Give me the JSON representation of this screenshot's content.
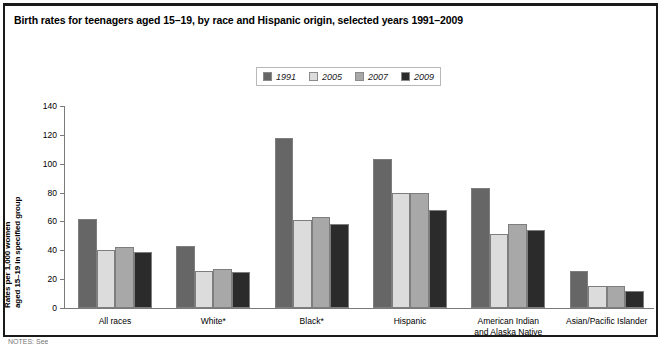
{
  "title": "Birth rates for teenagers aged 15–19, by race and Hispanic origin, selected years 1991–2009",
  "footnote": "NOTES: See",
  "legend": {
    "items": [
      {
        "label": "1991",
        "color": "#666666"
      },
      {
        "label": "2005",
        "color": "#dcdcdc"
      },
      {
        "label": "2007",
        "color": "#a8a8a8"
      },
      {
        "label": "2009",
        "color": "#2b2b2b"
      }
    ]
  },
  "axis": {
    "y_title_line1": "Rates per 1,000 women",
    "y_title_line2": "aged 15–19 in specified group",
    "y_ticks": [
      "140",
      "120",
      "100",
      "80",
      "60",
      "40",
      "20",
      "0"
    ]
  },
  "chart_data": {
    "type": "bar",
    "title": "Birth rates for teenagers aged 15–19, by race and Hispanic origin, selected years 1991–2009",
    "xlabel": "",
    "ylabel": "Rates per 1,000 women aged 15–19 in specified group",
    "ylim": [
      0,
      140
    ],
    "ytick_step": 20,
    "grid": false,
    "legend_position": "top-center",
    "categories": [
      "All races",
      "White*",
      "Black*",
      "Hispanic",
      "American Indian and Alaska Native",
      "Asian/Pacific Islander"
    ],
    "category_labels": [
      [
        "All races"
      ],
      [
        "White*"
      ],
      [
        "Black*"
      ],
      [
        "Hispanic"
      ],
      [
        "American Indian",
        "and Alaska Native"
      ],
      [
        "Asian/Pacific Islander"
      ]
    ],
    "series": [
      {
        "name": "1991",
        "color": "#666666",
        "values": [
          62,
          43,
          118,
          103,
          83,
          26
        ]
      },
      {
        "name": "2005",
        "color": "#dcdcdc",
        "values": [
          40,
          26,
          61,
          80,
          51,
          15
        ]
      },
      {
        "name": "2007",
        "color": "#a8a8a8",
        "values": [
          42,
          27,
          63,
          80,
          58,
          15
        ]
      },
      {
        "name": "2009",
        "color": "#2b2b2b",
        "values": [
          39,
          25,
          58,
          68,
          54,
          12
        ]
      }
    ]
  }
}
